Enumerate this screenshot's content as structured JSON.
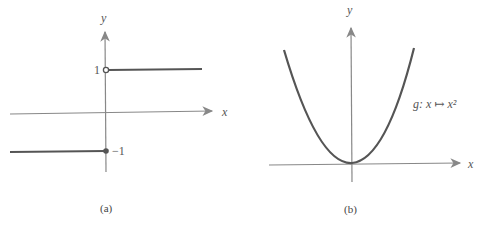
{
  "panel_a": {
    "caption": "(a)",
    "x_label": "x",
    "y_label": "y",
    "upper_value_label": "1",
    "lower_value_label": "−1",
    "description": "Step function: y = 1 for x > 0 (open circle at x=0), y = -1 for x <= 0 (closed dot at x=0)"
  },
  "panel_b": {
    "caption": "(b)",
    "x_label": "x",
    "y_label": "y",
    "function_label": "g: x ↦ x²",
    "description": "Parabola y = x² with vertex at origin"
  },
  "colors": {
    "curve": "#555555",
    "axis": "#777777",
    "text": "#555555"
  }
}
